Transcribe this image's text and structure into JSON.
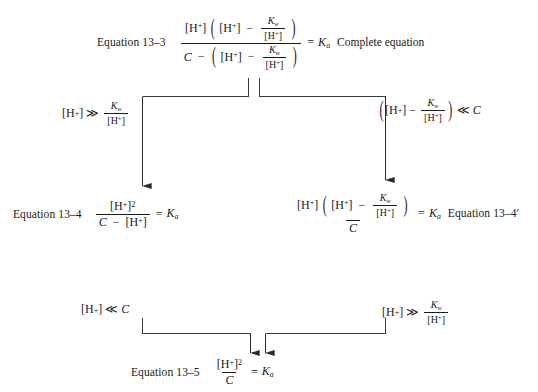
{
  "figure": {
    "type": "flowchart",
    "background_color": "#ffffff",
    "line_color": "#3a3a3a"
  },
  "nodes": {
    "eq13_3": {
      "label": "Equation 13–3",
      "tag": "Complete equation",
      "numerator_lead": "[H",
      "expression_plain": "[H+]([H+] − Kw/[H+]) / (C − ([H+] − Kw/[H+])) = Ka",
      "result": "K",
      "result_sub": "a"
    },
    "eq13_4": {
      "label": "Equation 13–4",
      "expression_plain": "[H+]² / (C − [H+]) = Ka",
      "result": "K",
      "result_sub": "a"
    },
    "eq13_4_prime": {
      "label": "Equation 13–4′",
      "expression_plain": "[H+]([H+] − Kw/[H+]) / C = Ka",
      "result": "K",
      "result_sub": "a"
    },
    "eq13_5": {
      "label": "Equation 13–5",
      "expression_plain": "[H+]² / C = Ka",
      "result": "K",
      "result_sub": "a"
    }
  },
  "conditions": {
    "left_top": {
      "plain": "[H+] ≫ Kw/[H+]",
      "operator": "≫"
    },
    "right_top": {
      "plain": "([H+] − Kw/[H+]) ≪ C",
      "operator": "≪"
    },
    "left_bottom": {
      "plain": "[H+] ≪ C",
      "operator": "≪"
    },
    "right_bottom": {
      "plain": "[H+] ≫ Kw/[H+]",
      "operator": "≫"
    }
  },
  "symbols": {
    "H": "H",
    "charge": "+",
    "bracket_open": "[",
    "bracket_close": "]",
    "K": "K",
    "sub_w": "w",
    "sub_a": "a",
    "C": "C",
    "equals": "=",
    "minus": "−",
    "squared": "2",
    "paren_open": "(",
    "paren_close": ")",
    "much_greater": "≫",
    "much_less": "≪",
    "prime": "′"
  }
}
